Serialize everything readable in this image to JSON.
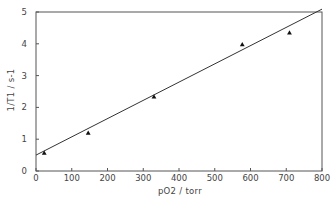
{
  "chart_data": {
    "type": "scatter",
    "title": "",
    "xlabel": "pO2 / torr",
    "ylabel": "1/T1 / s-1",
    "xlim": [
      0,
      800
    ],
    "ylim": [
      0,
      5
    ],
    "xticks": [
      0,
      100,
      200,
      300,
      400,
      500,
      600,
      700,
      800
    ],
    "yticks": [
      0,
      1,
      2,
      3,
      4,
      5
    ],
    "grid": false,
    "legend": null,
    "series": [
      {
        "name": "measured",
        "marker": "triangle",
        "x": [
          23,
          146,
          330,
          577,
          709
        ],
        "y": [
          0.57,
          1.2,
          2.34,
          3.98,
          4.35
        ]
      }
    ],
    "fit_line": {
      "name": "linear fit",
      "x": [
        0,
        800
      ],
      "y": [
        0.5,
        5.09
      ]
    }
  },
  "colors": {
    "axis": "#555555",
    "line": "#333333",
    "marker": "#111111",
    "text": "#444444",
    "background": "#ffffff"
  }
}
